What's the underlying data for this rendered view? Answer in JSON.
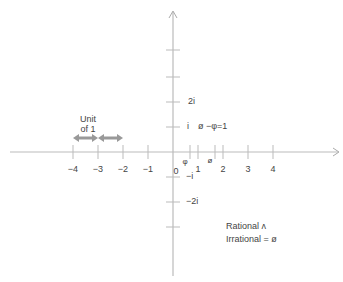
{
  "diagram": {
    "type": "complex-plane-number-line",
    "colors": {
      "axis": "#bbbbbb",
      "text": "#444444",
      "arrow": "#999999"
    },
    "x_ticks": [
      {
        "label": "−4",
        "x": 73
      },
      {
        "label": "−3",
        "x": 98
      },
      {
        "label": "−2",
        "x": 123
      },
      {
        "label": "−1",
        "x": 148
      },
      {
        "label": "0",
        "x": 176
      },
      {
        "label": "1",
        "x": 198
      },
      {
        "label": "2",
        "x": 223
      },
      {
        "label": "3",
        "x": 248
      },
      {
        "label": "4",
        "x": 273
      }
    ],
    "y_ticks": [
      {
        "label": "2i",
        "y": 102
      },
      {
        "label": "i",
        "y": 127
      },
      {
        "label": "−i",
        "y": 177
      },
      {
        "label": "−2i",
        "y": 202
      }
    ],
    "special_points": [
      {
        "label": "φ",
        "value": 0.618
      },
      {
        "label": "ø",
        "value": 1.618
      }
    ],
    "equation": "ø −φ=1",
    "unit_label_line1": "Unit",
    "unit_label_line2": "of 1",
    "legend": {
      "rational": "Rational  ʌ",
      "irrational": "Irrational = ø"
    }
  }
}
